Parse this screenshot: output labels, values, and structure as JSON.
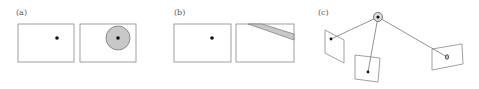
{
  "panels": {
    "a": {
      "label": "(a)",
      "left_frame": {
        "x": 18,
        "y": 24,
        "w": 56,
        "h": 38,
        "point": {
          "cx": 57,
          "cy": 38
        }
      },
      "right_frame": {
        "x": 80,
        "y": 24,
        "w": 56,
        "h": 38,
        "point": {
          "cx": 118,
          "cy": 38
        },
        "region": {
          "shape": "circle",
          "cx": 118,
          "cy": 38,
          "r": 12
        }
      }
    },
    "b": {
      "label": "(b)",
      "left_frame": {
        "x": 174,
        "y": 24,
        "w": 57,
        "h": 38,
        "point": {
          "cx": 212,
          "cy": 38
        }
      },
      "right_frame": {
        "x": 236,
        "y": 24,
        "w": 58,
        "h": 38,
        "region": {
          "shape": "band",
          "points": "248,24 262,24 294,34 294,40"
        }
      }
    },
    "c": {
      "label": "(c)",
      "center": {
        "cx": 378,
        "cy": 17
      },
      "planes": [
        {
          "name": "left",
          "points": "325,30 344,40 344,63 325,53",
          "point": {
            "cx": 331,
            "cy": 39
          }
        },
        {
          "name": "middle",
          "points": "355,55 380,58 378,82 355,79",
          "point": {
            "cx": 368,
            "cy": 72
          }
        },
        {
          "name": "right",
          "points": "432,49 462,44 463,64 432,70",
          "point": {
            "cx": 447,
            "cy": 57
          }
        }
      ]
    }
  },
  "colors": {
    "frame_stroke": "#888888",
    "region_fill": "#c8c8c8",
    "point": "#111111",
    "ray": "#777777",
    "label": "#555555"
  }
}
